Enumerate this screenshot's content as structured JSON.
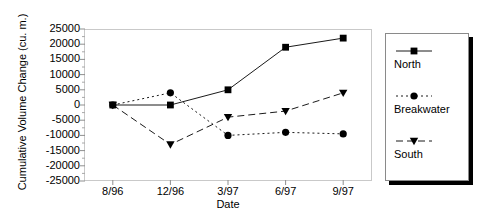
{
  "chart_data": {
    "type": "line",
    "title": "",
    "xlabel": "Date",
    "ylabel": "Cumulative Volume Change (cu. m.)",
    "categories": [
      "8/96",
      "12/96",
      "3/97",
      "6/97",
      "9/97"
    ],
    "ylim": [
      -25000,
      25000
    ],
    "ytick_values": [
      25000,
      20000,
      15000,
      10000,
      5000,
      0,
      -5000,
      -10000,
      -15000,
      -20000,
      -25000
    ],
    "ytick_labels": [
      "25000",
      "20000",
      "15000",
      "10000",
      "5000",
      "0",
      "-5000",
      "-10000",
      "-15000",
      "-20000",
      "-25000"
    ],
    "grid": false,
    "legend_position": "right",
    "minor_ticks": true,
    "series": [
      {
        "name": "North",
        "marker": "square",
        "linestyle": "solid",
        "color": "#000000",
        "values": [
          0,
          0,
          5000,
          19000,
          22000
        ]
      },
      {
        "name": "Breakwater",
        "marker": "circle",
        "linestyle": "dotted",
        "color": "#000000",
        "values": [
          0,
          4000,
          -10000,
          -9000,
          -9500
        ]
      },
      {
        "name": "South",
        "marker": "triangle-down",
        "linestyle": "dashed",
        "color": "#000000",
        "values": [
          0,
          -13000,
          -4000,
          -2000,
          4000
        ]
      }
    ]
  },
  "legend": {
    "entries": [
      {
        "label": "North"
      },
      {
        "label": "Breakwater"
      },
      {
        "label": "South"
      }
    ]
  }
}
